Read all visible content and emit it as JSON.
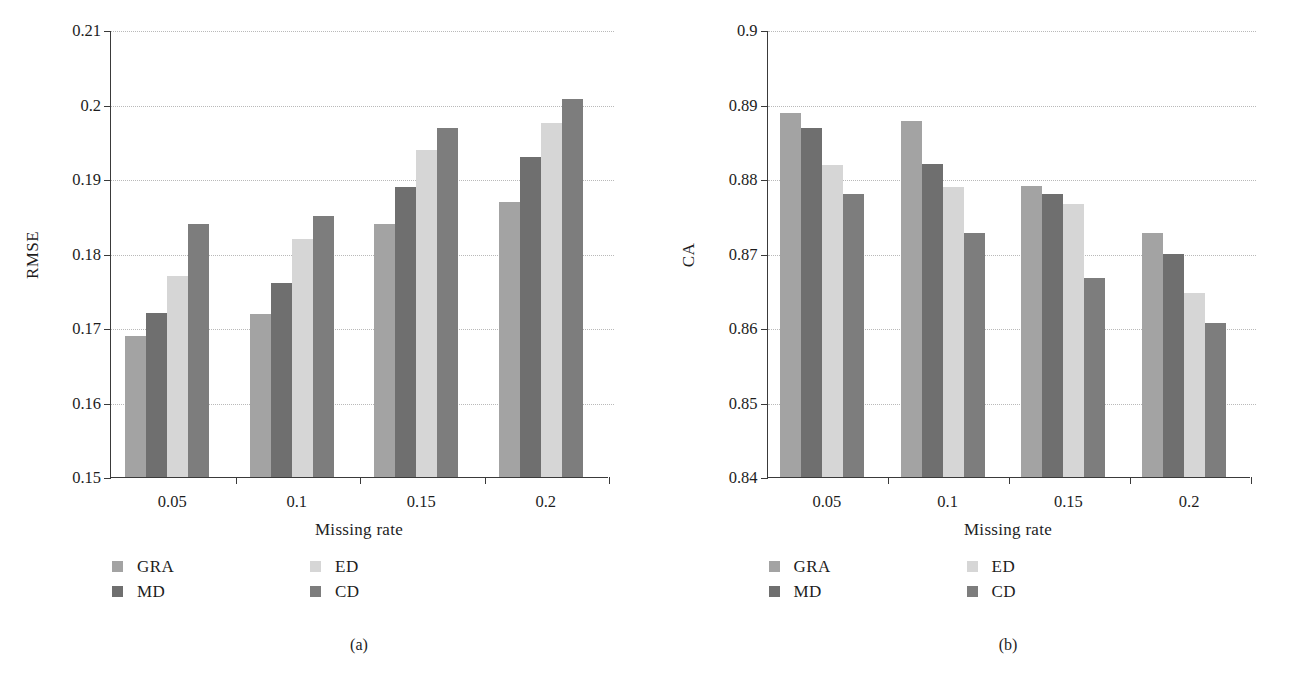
{
  "figure": {
    "panels": [
      {
        "id": "a",
        "caption": "(a)",
        "chart_data": {
          "type": "bar",
          "title": "",
          "xlabel": "Missing rate",
          "ylabel": "RMSE",
          "categories": [
            "0.05",
            "0.1",
            "0.15",
            "0.2"
          ],
          "ylim": [
            0.15,
            0.21
          ],
          "yticks": [
            "0.15",
            "0.16",
            "0.17",
            "0.18",
            "0.19",
            "0.2",
            "0.21"
          ],
          "ytick_values": [
            0.15,
            0.16,
            0.17,
            0.18,
            0.19,
            0.2,
            0.21
          ],
          "grid": true,
          "legend_position": "below",
          "series": [
            {
              "name": "GRA",
              "color": "#a3a3a3",
              "values": [
                0.1689,
                0.1719,
                0.1839,
                0.1869
              ]
            },
            {
              "name": "MD",
              "color": "#6f6f6f",
              "values": [
                0.172,
                0.176,
                0.1889,
                0.193
              ]
            },
            {
              "name": "ED",
              "color": "#d6d6d6",
              "values": [
                0.177,
                0.182,
                0.1939,
                0.1975
              ]
            },
            {
              "name": "CD",
              "color": "#7d7d7d",
              "values": [
                0.184,
                0.185,
                0.1969,
                0.2008
              ]
            }
          ]
        }
      },
      {
        "id": "b",
        "caption": "(b)",
        "chart_data": {
          "type": "bar",
          "title": "",
          "xlabel": "Missing rate",
          "ylabel": "CA",
          "categories": [
            "0.05",
            "0.1",
            "0.15",
            "0.2"
          ],
          "ylim": [
            0.84,
            0.9
          ],
          "yticks": [
            "0.84",
            "0.85",
            "0.86",
            "0.87",
            "0.88",
            "0.89",
            "0.9"
          ],
          "ytick_values": [
            0.84,
            0.85,
            0.86,
            0.87,
            0.88,
            0.89,
            0.9
          ],
          "grid": true,
          "legend_position": "below",
          "series": [
            {
              "name": "GRA",
              "color": "#a3a3a3",
              "values": [
                0.8889,
                0.8878,
                0.879,
                0.8727
              ]
            },
            {
              "name": "MD",
              "color": "#6f6f6f",
              "values": [
                0.8869,
                0.882,
                0.878,
                0.8699
              ]
            },
            {
              "name": "ED",
              "color": "#d6d6d6",
              "values": [
                0.8819,
                0.8789,
                0.8767,
                0.8647
              ]
            },
            {
              "name": "CD",
              "color": "#7d7d7d",
              "values": [
                0.878,
                0.8727,
                0.8667,
                0.8607
              ]
            }
          ]
        }
      }
    ],
    "legend": {
      "entries": [
        {
          "label": "GRA",
          "color": "#a3a3a3"
        },
        {
          "label": "ED",
          "color": "#d6d6d6"
        },
        {
          "label": "MD",
          "color": "#6f6f6f"
        },
        {
          "label": "CD",
          "color": "#7d7d7d"
        }
      ]
    },
    "colors": {
      "axis": "#3a3a3a",
      "grid": "#b9b9b9",
      "text": "#1d1d1d",
      "background": "#ffffff"
    }
  }
}
